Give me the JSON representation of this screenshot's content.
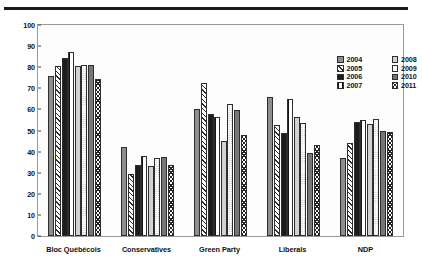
{
  "chart_data": {
    "type": "bar",
    "title": "",
    "subtitle": "",
    "xlabel": "",
    "ylabel": "Percent of revenue",
    "ylim": [
      0,
      100
    ],
    "ytick_step": 10,
    "yticks": [
      0,
      10,
      20,
      30,
      40,
      50,
      60,
      70,
      80,
      90,
      100
    ],
    "grid": false,
    "legend_position": "top-right",
    "categories": [
      "Bloc Québécois",
      "Conservatives",
      "Green Party",
      "Liberals",
      "NDP"
    ],
    "series": [
      {
        "name": "2004",
        "pattern": "solid-medium-gray",
        "color": "#8e8e8e",
        "values": [
          76,
          42,
          60,
          66,
          37
        ]
      },
      {
        "name": "2005",
        "pattern": "diagonal-hatch",
        "color": "#ffffff",
        "values": [
          80.5,
          29.5,
          72.5,
          52.5,
          44
        ]
      },
      {
        "name": "2006",
        "pattern": "solid-black",
        "color": "#1d1d1d",
        "values": [
          84.5,
          33.5,
          58,
          49,
          54
        ]
      },
      {
        "name": "2007",
        "pattern": "black-with-white-dots",
        "color": "#141414",
        "values": [
          87,
          38,
          56.5,
          65,
          55
        ]
      },
      {
        "name": "2008",
        "pattern": "solid-light-gray",
        "color": "#d2d2d2",
        "values": [
          80.5,
          33,
          45,
          56.5,
          53
        ]
      },
      {
        "name": "2009",
        "pattern": "fine-stipple",
        "color": "#ffffff",
        "values": [
          81,
          37,
          62.5,
          53.5,
          55.5
        ]
      },
      {
        "name": "2010",
        "pattern": "solid-dark-gray",
        "color": "#767676",
        "values": [
          81,
          37.5,
          59.5,
          39.5,
          50
        ]
      },
      {
        "name": "2011",
        "pattern": "cross-hatch-x",
        "color": "#ffffff",
        "values": [
          74.5,
          33.5,
          48,
          43,
          49.5
        ]
      }
    ]
  },
  "axes": {
    "y_label": "Percent of revenue",
    "y_tick_labels": [
      "0",
      "10",
      "20",
      "30",
      "40",
      "50",
      "60",
      "70",
      "80",
      "90",
      "100"
    ],
    "x_tick_labels": [
      "Bloc Québécois",
      "Conservatives",
      "Green Party",
      "Liberals",
      "NDP"
    ]
  },
  "legend": {
    "entries": [
      {
        "label": "2004",
        "swatch": "swatch-2004"
      },
      {
        "label": "2008",
        "swatch": "swatch-2008"
      },
      {
        "label": "2005",
        "swatch": "swatch-2005"
      },
      {
        "label": "2009",
        "swatch": "swatch-2009"
      },
      {
        "label": "2006",
        "swatch": "swatch-2006"
      },
      {
        "label": "2010",
        "swatch": "swatch-2010"
      },
      {
        "label": "2007",
        "swatch": "swatch-2007"
      },
      {
        "label": "2011",
        "swatch": "swatch-2011"
      }
    ]
  },
  "colors": {
    "rule": "#1a1a1a",
    "frame": "#9a9a9a",
    "text": "#111111",
    "background": "#ffffff"
  }
}
